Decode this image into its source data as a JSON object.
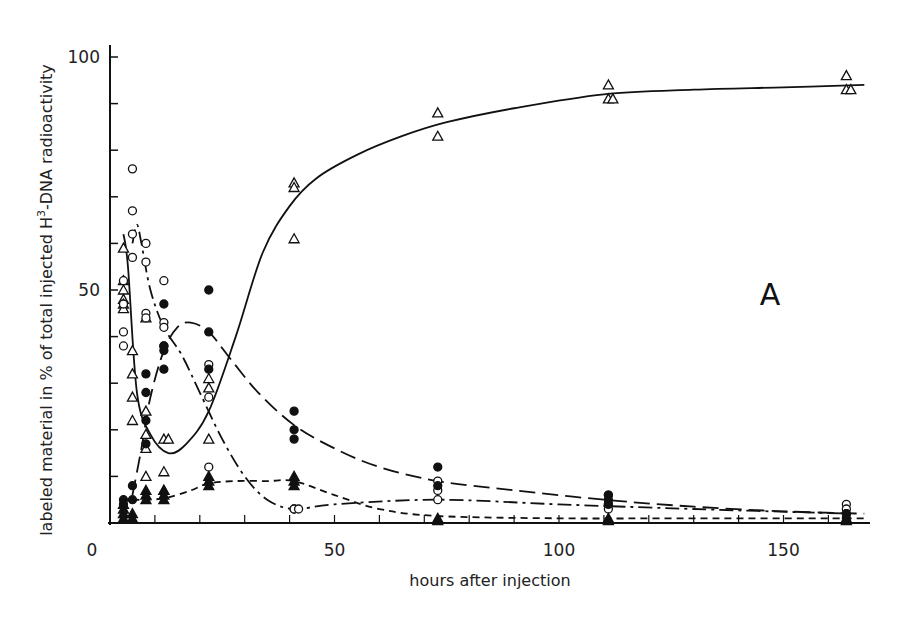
{
  "chart_data": {
    "type": "scatter",
    "title": "",
    "panel_label": "A",
    "xlabel": "hours after injection",
    "ylabel": "labeled material in % of total injected H³-DNA radioactivity",
    "ylabel_parts": {
      "before": "labeled material in % of total injected H",
      "superscript": "3",
      "after": "-DNA radioactivity"
    },
    "xlim": [
      0,
      170
    ],
    "ylim": [
      0,
      100
    ],
    "x_ticks": [
      0,
      50,
      100,
      150
    ],
    "x_minor_ticks": [
      10,
      20,
      30,
      40,
      60,
      70,
      80,
      90,
      110,
      120,
      130,
      140,
      160
    ],
    "y_ticks": [
      50,
      100
    ],
    "y_minor_ticks": [
      10,
      20,
      30,
      40,
      60,
      70,
      80,
      90
    ],
    "grid": false,
    "legend": "none",
    "series": [
      {
        "name": "open triangles",
        "marker": "triangle-open",
        "line_style": "solid",
        "points": [
          [
            3,
            59
          ],
          [
            3,
            52
          ],
          [
            3,
            50
          ],
          [
            3,
            48
          ],
          [
            3,
            47
          ],
          [
            3,
            46
          ],
          [
            5,
            37
          ],
          [
            5,
            32
          ],
          [
            5,
            27
          ],
          [
            5,
            22
          ],
          [
            8,
            24
          ],
          [
            8,
            19
          ],
          [
            8,
            16
          ],
          [
            8,
            10
          ],
          [
            8,
            44
          ],
          [
            12,
            18
          ],
          [
            13,
            18
          ],
          [
            12,
            11
          ],
          [
            12,
            7
          ],
          [
            22,
            31
          ],
          [
            22,
            29
          ],
          [
            22,
            18
          ],
          [
            41,
            73
          ],
          [
            41,
            72
          ],
          [
            41,
            61
          ],
          [
            73,
            88
          ],
          [
            73,
            83
          ],
          [
            111,
            94
          ],
          [
            111,
            91
          ],
          [
            112,
            91
          ],
          [
            164,
            96
          ],
          [
            164,
            93
          ],
          [
            165,
            93
          ]
        ],
        "curve": [
          [
            3,
            62
          ],
          [
            4,
            55
          ],
          [
            6,
            28
          ],
          [
            9,
            19
          ],
          [
            13,
            15
          ],
          [
            17,
            17
          ],
          [
            22,
            24
          ],
          [
            28,
            40
          ],
          [
            34,
            58
          ],
          [
            40,
            68
          ],
          [
            46,
            74
          ],
          [
            55,
            79
          ],
          [
            65,
            83
          ],
          [
            75,
            86
          ],
          [
            90,
            89
          ],
          [
            110,
            92
          ],
          [
            130,
            93
          ],
          [
            150,
            93.5
          ],
          [
            168,
            94
          ]
        ]
      },
      {
        "name": "open circles",
        "marker": "circle-open",
        "line_style": "dash-dot",
        "points": [
          [
            3,
            52
          ],
          [
            3,
            47
          ],
          [
            3,
            41
          ],
          [
            3,
            38
          ],
          [
            5,
            76
          ],
          [
            5,
            67
          ],
          [
            5,
            62
          ],
          [
            5,
            57
          ],
          [
            8,
            60
          ],
          [
            8,
            56
          ],
          [
            8,
            45
          ],
          [
            8,
            44
          ],
          [
            12,
            52
          ],
          [
            12,
            43
          ],
          [
            12,
            42
          ],
          [
            12,
            38
          ],
          [
            22,
            34
          ],
          [
            22,
            27
          ],
          [
            22,
            12
          ],
          [
            41,
            3
          ],
          [
            41,
            3
          ],
          [
            42,
            3
          ],
          [
            73,
            9
          ],
          [
            73,
            7
          ],
          [
            73,
            5
          ],
          [
            111,
            6
          ],
          [
            111,
            4
          ],
          [
            111,
            3
          ],
          [
            164,
            4
          ],
          [
            164,
            3
          ],
          [
            164,
            2
          ]
        ],
        "curve": [
          [
            5,
            60
          ],
          [
            6,
            64
          ],
          [
            7,
            60
          ],
          [
            9,
            50
          ],
          [
            12,
            42
          ],
          [
            16,
            36
          ],
          [
            20,
            28
          ],
          [
            25,
            18
          ],
          [
            30,
            10
          ],
          [
            35,
            5
          ],
          [
            41,
            3
          ],
          [
            50,
            4
          ],
          [
            73,
            5
          ],
          [
            100,
            4
          ],
          [
            130,
            3
          ],
          [
            165,
            2
          ]
        ]
      },
      {
        "name": "filled circles",
        "marker": "circle-filled",
        "line_style": "long-dash",
        "points": [
          [
            3,
            5
          ],
          [
            3,
            4
          ],
          [
            5,
            8
          ],
          [
            5,
            5
          ],
          [
            8,
            32
          ],
          [
            8,
            28
          ],
          [
            8,
            22
          ],
          [
            8,
            17
          ],
          [
            12,
            47
          ],
          [
            12,
            38
          ],
          [
            12,
            37
          ],
          [
            12,
            33
          ],
          [
            22,
            50
          ],
          [
            22,
            41
          ],
          [
            22,
            33
          ],
          [
            41,
            24
          ],
          [
            41,
            20
          ],
          [
            41,
            18
          ],
          [
            73,
            12
          ],
          [
            73,
            8
          ],
          [
            111,
            6
          ],
          [
            111,
            5
          ],
          [
            111,
            4
          ],
          [
            164,
            2
          ],
          [
            164,
            1
          ]
        ],
        "curve": [
          [
            5,
            6
          ],
          [
            7,
            16
          ],
          [
            9,
            27
          ],
          [
            12,
            37
          ],
          [
            15,
            42
          ],
          [
            18,
            43
          ],
          [
            22,
            41
          ],
          [
            27,
            35
          ],
          [
            33,
            28
          ],
          [
            41,
            21
          ],
          [
            50,
            16
          ],
          [
            60,
            12
          ],
          [
            73,
            9
          ],
          [
            90,
            7
          ],
          [
            110,
            5
          ],
          [
            130,
            3.5
          ],
          [
            150,
            2.5
          ],
          [
            168,
            2
          ]
        ]
      },
      {
        "name": "filled triangles",
        "marker": "triangle-filled",
        "line_style": "short-dash",
        "points": [
          [
            3,
            4
          ],
          [
            3,
            3
          ],
          [
            3,
            2
          ],
          [
            3,
            1
          ],
          [
            5,
            2
          ],
          [
            5,
            1
          ],
          [
            8,
            7
          ],
          [
            8,
            6
          ],
          [
            8,
            5
          ],
          [
            12,
            7
          ],
          [
            12,
            6
          ],
          [
            12,
            5
          ],
          [
            22,
            10
          ],
          [
            22,
            9
          ],
          [
            22,
            8
          ],
          [
            41,
            10
          ],
          [
            41,
            9
          ],
          [
            41,
            8
          ],
          [
            73,
            1
          ],
          [
            73,
            0.5
          ],
          [
            111,
            1
          ],
          [
            111,
            0.5
          ],
          [
            164,
            1
          ],
          [
            164,
            0.5
          ]
        ],
        "curve": [
          [
            5,
            5
          ],
          [
            9,
            5
          ],
          [
            13,
            5.5
          ],
          [
            18,
            7
          ],
          [
            22,
            8.5
          ],
          [
            28,
            9
          ],
          [
            35,
            9
          ],
          [
            41,
            9
          ],
          [
            50,
            6
          ],
          [
            60,
            3
          ],
          [
            73,
            1.5
          ],
          [
            100,
            1
          ],
          [
            130,
            1
          ],
          [
            168,
            1
          ]
        ]
      }
    ]
  }
}
